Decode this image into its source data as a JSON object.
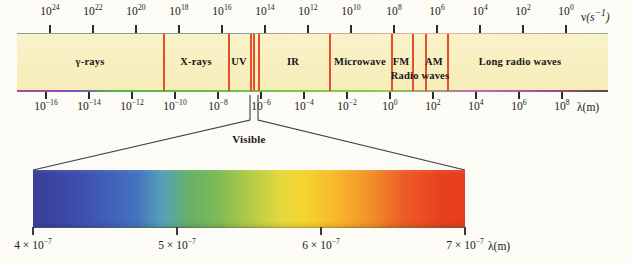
{
  "figure": {
    "background_color": "#fcfbf6",
    "bar_color": "#f8f0c4",
    "divider_color": "#e2502a"
  },
  "frequency_axis": {
    "name": "frequency-axis",
    "axis_title": "ν(s",
    "axis_title_exp": "−1",
    "axis_title_close": ")",
    "unit": "s^-1",
    "ticks": [
      {
        "label_base": "10",
        "label_exp": "24",
        "value": 24
      },
      {
        "label_base": "10",
        "label_exp": "22",
        "value": 22
      },
      {
        "label_base": "10",
        "label_exp": "20",
        "value": 20
      },
      {
        "label_base": "10",
        "label_exp": "18",
        "value": 18
      },
      {
        "label_base": "10",
        "label_exp": "16",
        "value": 16
      },
      {
        "label_base": "10",
        "label_exp": "14",
        "value": 14
      },
      {
        "label_base": "10",
        "label_exp": "12",
        "value": 12
      },
      {
        "label_base": "10",
        "label_exp": "10",
        "value": 10
      },
      {
        "label_base": "10",
        "label_exp": "8",
        "value": 8
      },
      {
        "label_base": "10",
        "label_exp": "6",
        "value": 6
      },
      {
        "label_base": "10",
        "label_exp": "4",
        "value": 4
      },
      {
        "label_base": "10",
        "label_exp": "2",
        "value": 2
      },
      {
        "label_base": "10",
        "label_exp": "0",
        "value": 0
      }
    ]
  },
  "wavelength_axis": {
    "name": "wavelength-axis",
    "axis_title": "λ(m)",
    "unit": "m",
    "ticks": [
      {
        "label_base": "10",
        "label_exp": "−16",
        "value": -16
      },
      {
        "label_base": "10",
        "label_exp": "−14",
        "value": -14
      },
      {
        "label_base": "10",
        "label_exp": "−12",
        "value": -12
      },
      {
        "label_base": "10",
        "label_exp": "−10",
        "value": -10
      },
      {
        "label_base": "10",
        "label_exp": "−8",
        "value": -8
      },
      {
        "label_base": "10",
        "label_exp": "−6",
        "value": -6
      },
      {
        "label_base": "10",
        "label_exp": "−4",
        "value": -4
      },
      {
        "label_base": "10",
        "label_exp": "−2",
        "value": -2
      },
      {
        "label_base": "10",
        "label_exp": "0",
        "value": 0
      },
      {
        "label_base": "10",
        "label_exp": "2",
        "value": 2
      },
      {
        "label_base": "10",
        "label_exp": "4",
        "value": 4
      },
      {
        "label_base": "10",
        "label_exp": "6",
        "value": 6
      },
      {
        "label_base": "10",
        "label_exp": "8",
        "value": 8
      }
    ]
  },
  "bands": [
    {
      "label": "γ-rays",
      "center_px": 90,
      "start_px": 17,
      "end_px": 163
    },
    {
      "label": "X-rays",
      "center_px": 196,
      "start_px": 163,
      "end_px": 228
    },
    {
      "label": "UV",
      "center_px": 239,
      "start_px": 228,
      "end_px": 250
    },
    {
      "label": "IR",
      "center_px": 293,
      "start_px": 258,
      "end_px": 329
    },
    {
      "label": "Microwave",
      "center_px": 360,
      "start_px": 329,
      "end_px": 391
    },
    {
      "label": "FM",
      "center_px": 401,
      "start_px": 391,
      "end_px": 412
    },
    {
      "label": "AM",
      "center_px": 434,
      "start_px": 425,
      "end_px": 447
    },
    {
      "label": "Long radio waves",
      "center_px": 520,
      "start_px": 447,
      "end_px": 608
    }
  ],
  "band_sublabel": {
    "label": "Radio waves",
    "center_px": 420
  },
  "dividers_px": [
    163,
    228,
    250,
    253,
    258,
    329,
    391,
    412,
    425,
    447
  ],
  "callout": {
    "label": "Visible",
    "source_left_px": 250,
    "source_right_px": 258,
    "target_left_px": 33,
    "target_right_px": 465
  },
  "visible_spectrum": {
    "name": "visible-spectrum-bar",
    "axis_title": "λ(m)",
    "ticks": [
      {
        "coef": "4",
        "base": "10",
        "exp": "−7",
        "pos": 0.0
      },
      {
        "coef": "5",
        "base": "10",
        "exp": "−7",
        "pos": 0.3333
      },
      {
        "coef": "6",
        "base": "10",
        "exp": "−7",
        "pos": 0.6667
      },
      {
        "coef": "7",
        "base": "10",
        "exp": "−7",
        "pos": 1.0
      }
    ],
    "range_m": [
      4e-07,
      7e-07
    ],
    "colors": [
      "#3a3f97",
      "#4472c0",
      "#66b06a",
      "#b9cc45",
      "#e8d83c",
      "#f7b92a",
      "#ec5b26",
      "#e73c1d"
    ]
  },
  "chart_data": {
    "type": "bar",
    "xlabel": "λ(m)",
    "ylabel": "",
    "categories": [
      "γ-rays",
      "X-rays",
      "UV",
      "Visible",
      "IR",
      "Microwave",
      "FM",
      "AM",
      "Long radio waves"
    ],
    "values": [
      1,
      1,
      1,
      1,
      1,
      1,
      1,
      1,
      1
    ],
    "axes": [
      {
        "name": "frequency",
        "label": "ν(s−1)",
        "ticks": [
          24,
          22,
          20,
          18,
          16,
          14,
          12,
          10,
          8,
          6,
          4,
          2,
          0
        ],
        "scale": "log10",
        "direction": "decreasing"
      },
      {
        "name": "wavelength",
        "label": "λ(m)",
        "ticks": [
          -16,
          -14,
          -12,
          -10,
          -8,
          -6,
          -4,
          -2,
          0,
          2,
          4,
          6,
          8
        ],
        "scale": "log10",
        "direction": "increasing"
      },
      {
        "name": "visible-wavelength",
        "label": "λ(m)",
        "ticks": [
          "4 × 10−7",
          "5 × 10−7",
          "6 × 10−7",
          "7 × 10−7"
        ],
        "scale": "linear"
      }
    ],
    "grid": false,
    "legend": "none"
  }
}
